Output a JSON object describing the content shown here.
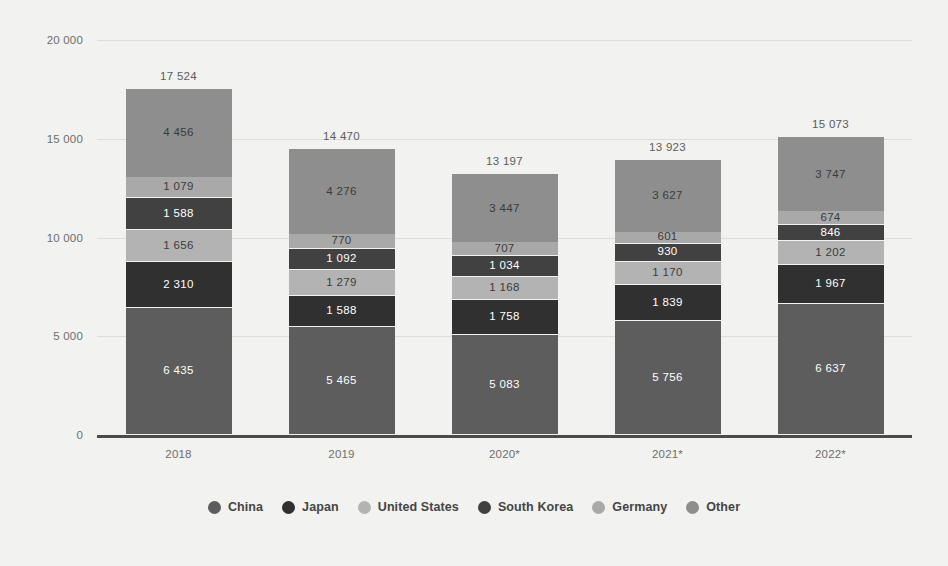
{
  "chart_data": {
    "type": "bar",
    "stacked": true,
    "title": "",
    "subtitle": "",
    "xlabel": "",
    "ylabel": "Sales in million U.S. dollars",
    "categories": [
      "2018",
      "2019",
      "2020*",
      "2021*",
      "2022*"
    ],
    "ylim": [
      0,
      20000
    ],
    "yticks": [
      0,
      5000,
      10000,
      15000,
      20000
    ],
    "ytick_labels": [
      "0",
      "5 000",
      "10 000",
      "15 000",
      "20 000"
    ],
    "grid": true,
    "legend_position": "bottom",
    "totals": [
      17524,
      14470,
      13197,
      13923,
      15073
    ],
    "total_labels": [
      "17 524",
      "14 470",
      "13 197",
      "13 923",
      "15 073"
    ],
    "series": [
      {
        "name": "China",
        "color": "#5d5d5d",
        "tone": "dark",
        "values": [
          6435,
          5465,
          5083,
          5756,
          6637
        ],
        "labels": [
          "6 435",
          "5 465",
          "5 083",
          "5 756",
          "6 637"
        ]
      },
      {
        "name": "Japan",
        "color": "#303030",
        "tone": "dark",
        "values": [
          2310,
          1588,
          1758,
          1839,
          1967
        ],
        "labels": [
          "2 310",
          "1 588",
          "1 758",
          "1 839",
          "1 967"
        ]
      },
      {
        "name": "United States",
        "color": "#b3b3b3",
        "tone": "light",
        "values": [
          1656,
          1279,
          1168,
          1170,
          1202
        ],
        "labels": [
          "1 656",
          "1 279",
          "1 168",
          "1 170",
          "1 202"
        ]
      },
      {
        "name": "South Korea",
        "color": "#414141",
        "tone": "dark",
        "values": [
          1588,
          1092,
          1034,
          930,
          846
        ],
        "labels": [
          "1 588",
          "1 092",
          "1 034",
          "930",
          "846"
        ]
      },
      {
        "name": "Germany",
        "color": "#a9a9a9",
        "tone": "light",
        "values": [
          1079,
          770,
          707,
          601,
          674
        ],
        "labels": [
          "1 079",
          "770",
          "707",
          "601",
          "674"
        ]
      },
      {
        "name": "Other",
        "color": "#8e8e8e",
        "tone": "light",
        "values": [
          4456,
          4276,
          3447,
          3627,
          3747
        ],
        "labels": [
          "4 456",
          "4 276",
          "3 447",
          "3 627",
          "3 747"
        ]
      }
    ]
  }
}
